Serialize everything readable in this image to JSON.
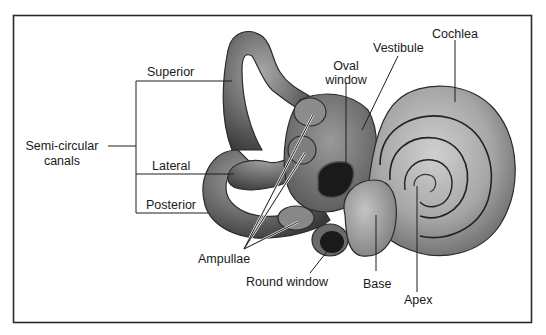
{
  "figure": {
    "colors": {
      "frame": "#2a2a2a",
      "background": "#ffffff",
      "structure_dark": "#4a4a4a",
      "structure_mid": "#7a7a7a",
      "structure_light": "#b8b8b8",
      "window_hole": "#1a1a1a"
    }
  },
  "labels": {
    "semicircular_line1": "Semi-circular",
    "semicircular_line2": "canals",
    "superior": "Superior",
    "lateral": "Lateral",
    "posterior": "Posterior",
    "ampullae": "Ampullae",
    "oval_window_line1": "Oval",
    "oval_window_line2": "window",
    "vestibule": "Vestibule",
    "cochlea": "Cochlea",
    "round_window": "Round window",
    "base": "Base",
    "apex": "Apex"
  }
}
